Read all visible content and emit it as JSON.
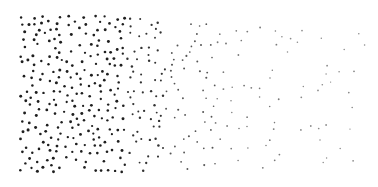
{
  "image": {
    "description": "Stipple gradient: dense dark dots on the left fading to sparse light dots on the right",
    "width": 378,
    "height": 187,
    "background": "#ffffff"
  },
  "stipple": {
    "seed": 7,
    "bands": [
      {
        "x0": 20,
        "x1": 60,
        "y0": 16,
        "y1": 172,
        "count": 95,
        "r": 1.35,
        "color": "#1e1e1e"
      },
      {
        "x0": 60,
        "x1": 125,
        "y0": 16,
        "y1": 172,
        "count": 140,
        "r": 1.3,
        "color": "#1f1f1f"
      },
      {
        "x0": 125,
        "x1": 165,
        "y0": 18,
        "y1": 172,
        "count": 62,
        "r": 1.1,
        "color": "#333333"
      },
      {
        "x0": 165,
        "x1": 215,
        "y0": 22,
        "y1": 170,
        "count": 52,
        "r": 0.95,
        "color": "#555555"
      },
      {
        "x0": 215,
        "x1": 280,
        "y0": 24,
        "y1": 168,
        "count": 40,
        "r": 0.85,
        "color": "#7a7a7a"
      },
      {
        "x0": 280,
        "x1": 365,
        "y0": 28,
        "y1": 165,
        "count": 30,
        "r": 0.8,
        "color": "#8a8a8a"
      }
    ],
    "min_spacing": 5.2
  }
}
